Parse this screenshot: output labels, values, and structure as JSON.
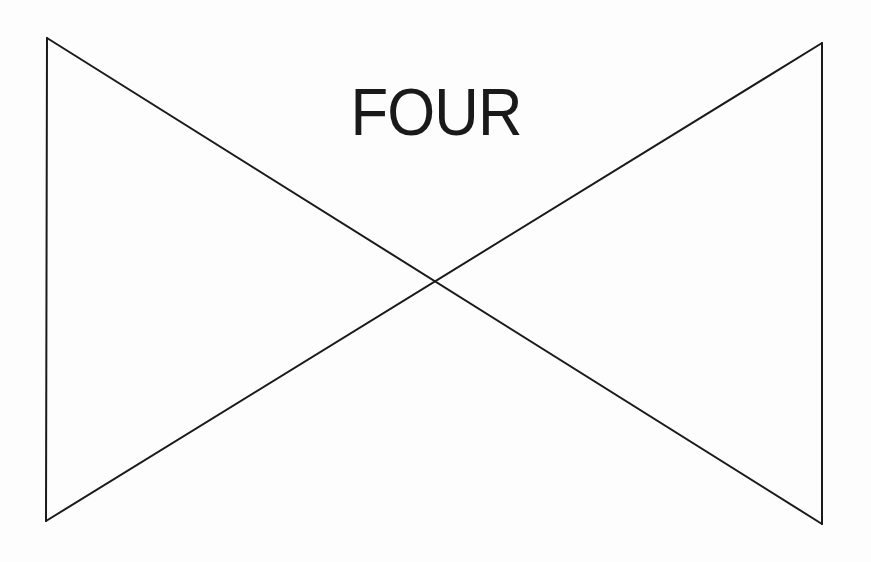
{
  "diagram": {
    "title": "FOUR",
    "stroke_color": "#1a1a1a",
    "background_color": "#fdfdfd",
    "stroke_width": 2,
    "vertices": {
      "top_left": [
        47,
        38
      ],
      "top_right": [
        822,
        43
      ],
      "bottom_left": [
        46,
        521
      ],
      "bottom_right": [
        822,
        524
      ],
      "crossing": [
        435,
        282
      ]
    },
    "lines": [
      {
        "name": "left-edge",
        "from": [
          47,
          38
        ],
        "to": [
          46,
          521
        ]
      },
      {
        "name": "right-edge",
        "from": [
          822,
          43
        ],
        "to": [
          822,
          524
        ]
      },
      {
        "name": "diagonal-top-left-to-bottom-right",
        "from": [
          47,
          38
        ],
        "to": [
          822,
          524
        ]
      },
      {
        "name": "diagonal-bottom-left-to-top-right",
        "from": [
          46,
          521
        ],
        "to": [
          822,
          43
        ]
      }
    ]
  }
}
